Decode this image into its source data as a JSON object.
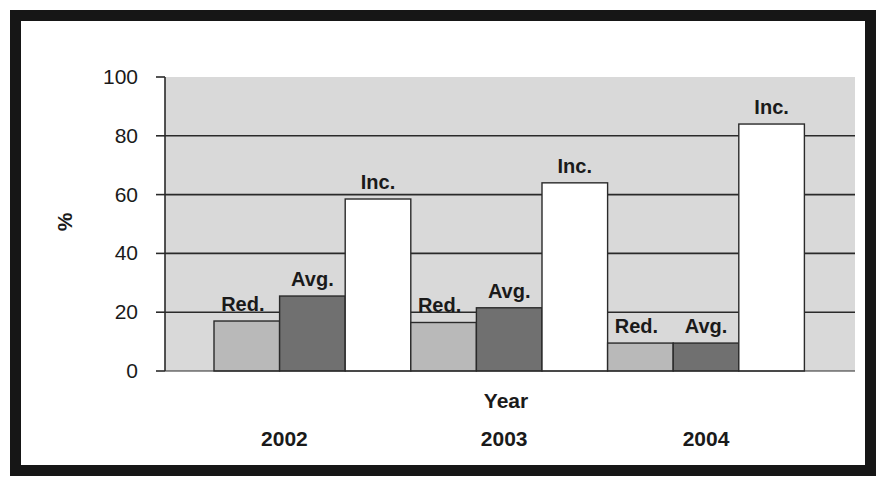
{
  "chart_data": {
    "type": "bar",
    "title": "",
    "xlabel": "Year",
    "ylabel": "%",
    "ylim": [
      0,
      100
    ],
    "yticks": [
      "0",
      "20",
      "40",
      "60",
      "80",
      "100"
    ],
    "grid": true,
    "legend": "none",
    "categories": [
      "2002",
      "2003",
      "2004"
    ],
    "series": [
      {
        "name": "Red.",
        "label": "Red.",
        "color": "#b9b9b9",
        "values": [
          17,
          16.5,
          9.5
        ]
      },
      {
        "name": "Avg.",
        "label": "Avg.",
        "color": "#707070",
        "values": [
          25.5,
          21.5,
          9.5
        ]
      },
      {
        "name": "Inc.",
        "label": "Inc.",
        "color": "#ffffff",
        "values": [
          58.5,
          64,
          84
        ]
      }
    ],
    "plot_background": "#d9d9d9"
  }
}
